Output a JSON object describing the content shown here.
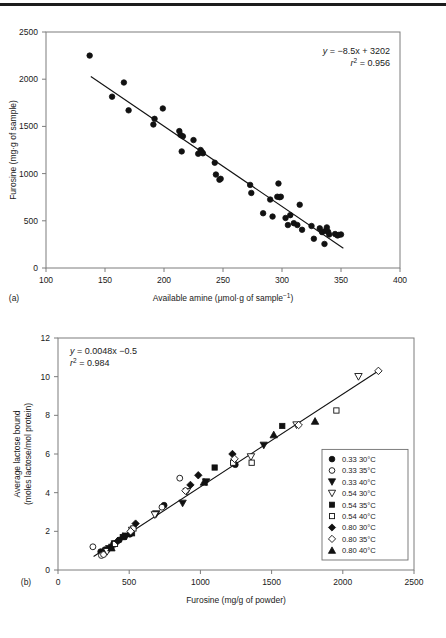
{
  "figure": {
    "panels": [
      {
        "id": "a",
        "label": "(a)",
        "equation_line1": "y = −8.5x + 3202",
        "equation_line2": "r² = 0.956",
        "xlabel": "Available amine (μmol·g of sample −1)",
        "ylabel": "Furosine (mg·g of sample)"
      },
      {
        "id": "b",
        "label": "(b)",
        "equation_line1": "y = 0.0048x −0.5",
        "equation_line2": "r² = 0.984",
        "xlabel": "Furosine (mg/g of powder)",
        "ylabel_line1": "Average lactose bound",
        "ylabel_line2": "(moles lactose/mol protein)"
      }
    ]
  },
  "chart_data": [
    {
      "type": "scatter",
      "panel": "a",
      "title": "",
      "xlabel": "Available amine (μmol·g of sample −1)",
      "ylabel": "Furosine (mg·g of sample)",
      "xlim": [
        100,
        400
      ],
      "ylim": [
        0,
        2500
      ],
      "xticks": [
        100,
        150,
        200,
        250,
        300,
        350,
        400
      ],
      "yticks": [
        0,
        500,
        1000,
        1500,
        2000,
        2500
      ],
      "grid": false,
      "legend": "none",
      "marker": "filled-circle",
      "annotations": [
        "y = −8.5x + 3202",
        "r² = 0.956"
      ],
      "fit": {
        "slope": -8.5,
        "intercept": 3202,
        "r2": 0.956,
        "x_start": 138,
        "x_end": 352
      },
      "points": [
        [
          137,
          2250
        ],
        [
          156,
          1815
        ],
        [
          166,
          1965
        ],
        [
          170,
          1670
        ],
        [
          191,
          1520
        ],
        [
          192,
          1580
        ],
        [
          199,
          1690
        ],
        [
          213,
          1450
        ],
        [
          214,
          1410
        ],
        [
          215,
          1235
        ],
        [
          216,
          1395
        ],
        [
          225,
          1355
        ],
        [
          229,
          1210
        ],
        [
          231,
          1250
        ],
        [
          232,
          1230
        ],
        [
          233,
          1215
        ],
        [
          243,
          1115
        ],
        [
          244,
          990
        ],
        [
          247,
          935
        ],
        [
          248,
          945
        ],
        [
          273,
          880
        ],
        [
          274,
          795
        ],
        [
          284,
          580
        ],
        [
          290,
          725
        ],
        [
          292,
          545
        ],
        [
          296,
          755
        ],
        [
          297,
          895
        ],
        [
          298,
          750
        ],
        [
          299,
          755
        ],
        [
          303,
          530
        ],
        [
          305,
          455
        ],
        [
          307,
          560
        ],
        [
          310,
          475
        ],
        [
          313,
          455
        ],
        [
          315,
          670
        ],
        [
          317,
          405
        ],
        [
          325,
          445
        ],
        [
          327,
          310
        ],
        [
          332,
          420
        ],
        [
          334,
          380
        ],
        [
          336,
          255
        ],
        [
          337,
          395
        ],
        [
          338,
          430
        ],
        [
          339,
          385
        ],
        [
          340,
          355
        ],
        [
          345,
          360
        ],
        [
          347,
          345
        ],
        [
          348,
          350
        ],
        [
          350,
          355
        ]
      ]
    },
    {
      "type": "scatter",
      "panel": "b",
      "title": "",
      "xlabel": "Furosine (mg/g of powder)",
      "ylabel": "Average lactose bound (moles lactose/mol protein)",
      "xlim": [
        0,
        2500
      ],
      "ylim": [
        0,
        12
      ],
      "xticks": [
        0,
        500,
        1000,
        1500,
        2000,
        2500
      ],
      "yticks": [
        0,
        2,
        4,
        6,
        8,
        10,
        12
      ],
      "grid": false,
      "legend": "lower-right",
      "annotations": [
        "y = 0.0048x −0.5",
        "r² = 0.984"
      ],
      "fit": {
        "slope": 0.0048,
        "intercept": -0.5,
        "r2": 0.984,
        "x_start": 250,
        "x_end": 2260
      },
      "series": [
        {
          "name": "0.33 30°C",
          "marker": "filled-circle",
          "points": [
            [
              300,
              0.95
            ],
            [
              315,
              0.85
            ],
            [
              330,
              1.05
            ],
            [
              390,
              1.35
            ],
            [
              430,
              1.55
            ],
            [
              505,
              1.85
            ],
            [
              745,
              3.35
            ],
            [
              1245,
              5.45
            ]
          ]
        },
        {
          "name": "0.33 35°C",
          "marker": "open-circle",
          "points": [
            [
              245,
              1.2
            ],
            [
              305,
              0.75
            ],
            [
              320,
              0.8
            ],
            [
              520,
              2.1
            ],
            [
              730,
              3.25
            ],
            [
              855,
              4.75
            ]
          ]
        },
        {
          "name": "0.33 40°C",
          "marker": "filled-down-triangle",
          "points": [
            [
              360,
              1.1
            ],
            [
              400,
              1.35
            ],
            [
              480,
              1.75
            ],
            [
              690,
              2.9
            ],
            [
              875,
              3.45
            ],
            [
              1040,
              4.55
            ],
            [
              1445,
              6.45
            ]
          ]
        },
        {
          "name": "0.54 30°C",
          "marker": "open-down-triangle",
          "points": [
            [
              345,
              0.95
            ],
            [
              520,
              2.05
            ],
            [
              680,
              2.85
            ],
            [
              905,
              4.05
            ],
            [
              1355,
              5.85
            ],
            [
              1675,
              7.5
            ],
            [
              2110,
              10.0
            ]
          ]
        },
        {
          "name": "0.54 35°C",
          "marker": "filled-square",
          "points": [
            [
              375,
              1.2
            ],
            [
              455,
              1.7
            ],
            [
              520,
              1.9
            ],
            [
              1100,
              5.3
            ],
            [
              1575,
              7.45
            ]
          ]
        },
        {
          "name": "0.54 40°C",
          "marker": "open-square",
          "points": [
            [
              400,
              1.35
            ],
            [
              530,
              2.15
            ],
            [
              1230,
              5.55
            ],
            [
              1360,
              5.55
            ],
            [
              1955,
              8.25
            ]
          ]
        },
        {
          "name": "0.80 30°C",
          "marker": "filled-diamond",
          "points": [
            [
              420,
              1.5
            ],
            [
              545,
              2.4
            ],
            [
              930,
              4.4
            ],
            [
              985,
              4.9
            ],
            [
              1225,
              6.0
            ]
          ]
        },
        {
          "name": "0.80 35°C",
          "marker": "open-diamond",
          "points": [
            [
              510,
              2.0
            ],
            [
              895,
              4.1
            ],
            [
              1240,
              5.75
            ],
            [
              1690,
              7.5
            ],
            [
              2250,
              10.3
            ]
          ]
        },
        {
          "name": "0.80 40°C",
          "marker": "filled-up-triangle",
          "points": [
            [
              375,
              1.15
            ],
            [
              455,
              1.75
            ],
            [
              1025,
              4.55
            ],
            [
              1515,
              7.0
            ],
            [
              1805,
              7.7
            ]
          ]
        }
      ]
    }
  ],
  "legend_entries": [
    {
      "marker": "filled-circle",
      "label": "0.33 30°C"
    },
    {
      "marker": "open-circle",
      "label": "0.33 35°C"
    },
    {
      "marker": "filled-down-triangle",
      "label": "0.33 40°C"
    },
    {
      "marker": "open-down-triangle",
      "label": "0.54 30°C"
    },
    {
      "marker": "filled-square",
      "label": "0.54 35°C"
    },
    {
      "marker": "open-square",
      "label": "0.54 40°C"
    },
    {
      "marker": "filled-diamond",
      "label": "0.80 30°C"
    },
    {
      "marker": "open-diamond",
      "label": "0.80 35°C"
    },
    {
      "marker": "filled-up-triangle",
      "label": "0.80 40°C"
    }
  ],
  "caption": {
    "sliver_text": ""
  },
  "colors": {
    "ink": "#111111",
    "axis": "#7c7c7c",
    "background": "#ffffff",
    "rule": "#1c1c1c"
  }
}
